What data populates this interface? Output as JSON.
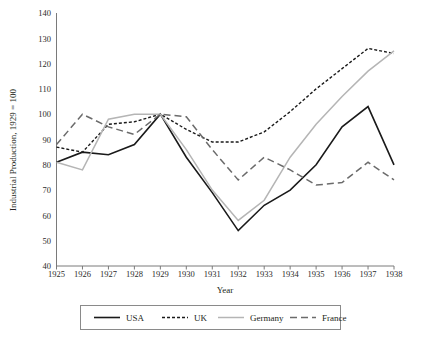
{
  "chart_data": {
    "type": "line",
    "title": "",
    "xlabel": "Year",
    "ylabel": "Industrial Production, 1929 = 100",
    "x": [
      1925,
      1926,
      1927,
      1928,
      1929,
      1930,
      1931,
      1932,
      1933,
      1934,
      1935,
      1936,
      1937,
      1938
    ],
    "xtick_labels": [
      "1925",
      "1926",
      "1927",
      "1928",
      "1929",
      "1930",
      "1931",
      "1932",
      "1933",
      "1934",
      "1935",
      "1936",
      "1937",
      "1938"
    ],
    "ytick_labels": [
      "40",
      "50",
      "60",
      "70",
      "80",
      "90",
      "100",
      "110",
      "120",
      "130",
      "140"
    ],
    "ylim": [
      40,
      140
    ],
    "xlim": [
      1925,
      1938
    ],
    "grid": false,
    "legend_position": "bottom",
    "series": [
      {
        "name": "USA",
        "color": "#1a1a1a",
        "dash": "none",
        "width": 1.6,
        "values": [
          81,
          85,
          84,
          88,
          100,
          83,
          69,
          54,
          64,
          70,
          80,
          95,
          103,
          80
        ]
      },
      {
        "name": "UK",
        "color": "#1a1a1a",
        "dash": "3,2",
        "width": 1.4,
        "values": [
          87,
          85,
          96,
          97,
          100,
          94,
          89,
          89,
          93,
          101,
          110,
          118,
          126,
          124
        ]
      },
      {
        "name": "Germany",
        "color": "#b5b5b5",
        "dash": "none",
        "width": 1.5,
        "values": [
          81,
          78,
          98,
          100,
          100,
          86,
          70,
          58,
          66,
          83,
          96,
          107,
          117,
          125
        ]
      },
      {
        "name": "France",
        "color": "#6b6b6b",
        "dash": "7,4",
        "width": 1.5,
        "values": [
          88,
          100,
          95,
          92,
          100,
          99,
          86,
          74,
          83,
          78,
          72,
          73,
          81,
          74
        ]
      }
    ]
  },
  "legend": {
    "entries": [
      {
        "label": "USA"
      },
      {
        "label": "UK"
      },
      {
        "label": "Germany"
      },
      {
        "label": "France"
      }
    ]
  }
}
